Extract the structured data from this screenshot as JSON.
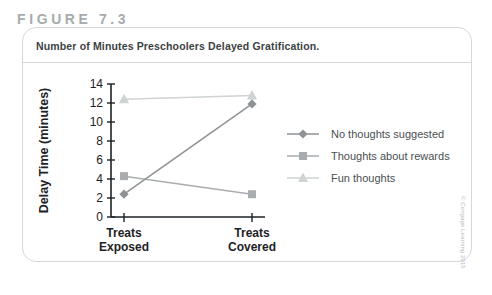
{
  "figure": {
    "number_label": "FIGURE 7.3",
    "caption": "Number of Minutes Preschoolers Delayed Gratification.",
    "copyright": "© Cengage Learning 2015"
  },
  "colors": {
    "series_no_thoughts": "#8e9294",
    "series_rewards": "#a9adaf",
    "series_fun": "#cfd3d4",
    "axis": "#1d2224",
    "caption_text": "#3b4245",
    "figure_label": "#a8abad",
    "card_border": "#d5d8da",
    "legend_text": "#4a5052"
  },
  "chart_data": {
    "type": "line",
    "title": "Number of Minutes Preschoolers Delayed Gratification.",
    "xlabel": "",
    "ylabel": "Delay Time (minutes)",
    "categories": [
      "Treats Exposed",
      "Treats Covered"
    ],
    "category_lines": [
      [
        "Treats",
        "Exposed"
      ],
      [
        "Treats",
        "Covered"
      ]
    ],
    "ylim": [
      0,
      14
    ],
    "yticks": [
      0,
      2,
      4,
      6,
      8,
      10,
      12,
      14
    ],
    "ytick_labels": [
      "0",
      "2",
      "4",
      "6",
      "8",
      "10",
      "12",
      "14"
    ],
    "grid": false,
    "legend_position": "right",
    "series": [
      {
        "name": "No thoughts suggested",
        "marker": "diamond",
        "color": "#8e9294",
        "values": [
          2.4,
          11.9
        ]
      },
      {
        "name": "Thoughts about rewards",
        "marker": "square",
        "color": "#a9adaf",
        "values": [
          4.3,
          2.4
        ]
      },
      {
        "name": "Fun thoughts",
        "marker": "triangle",
        "color": "#cfd3d4",
        "values": [
          12.4,
          12.8
        ]
      }
    ]
  }
}
